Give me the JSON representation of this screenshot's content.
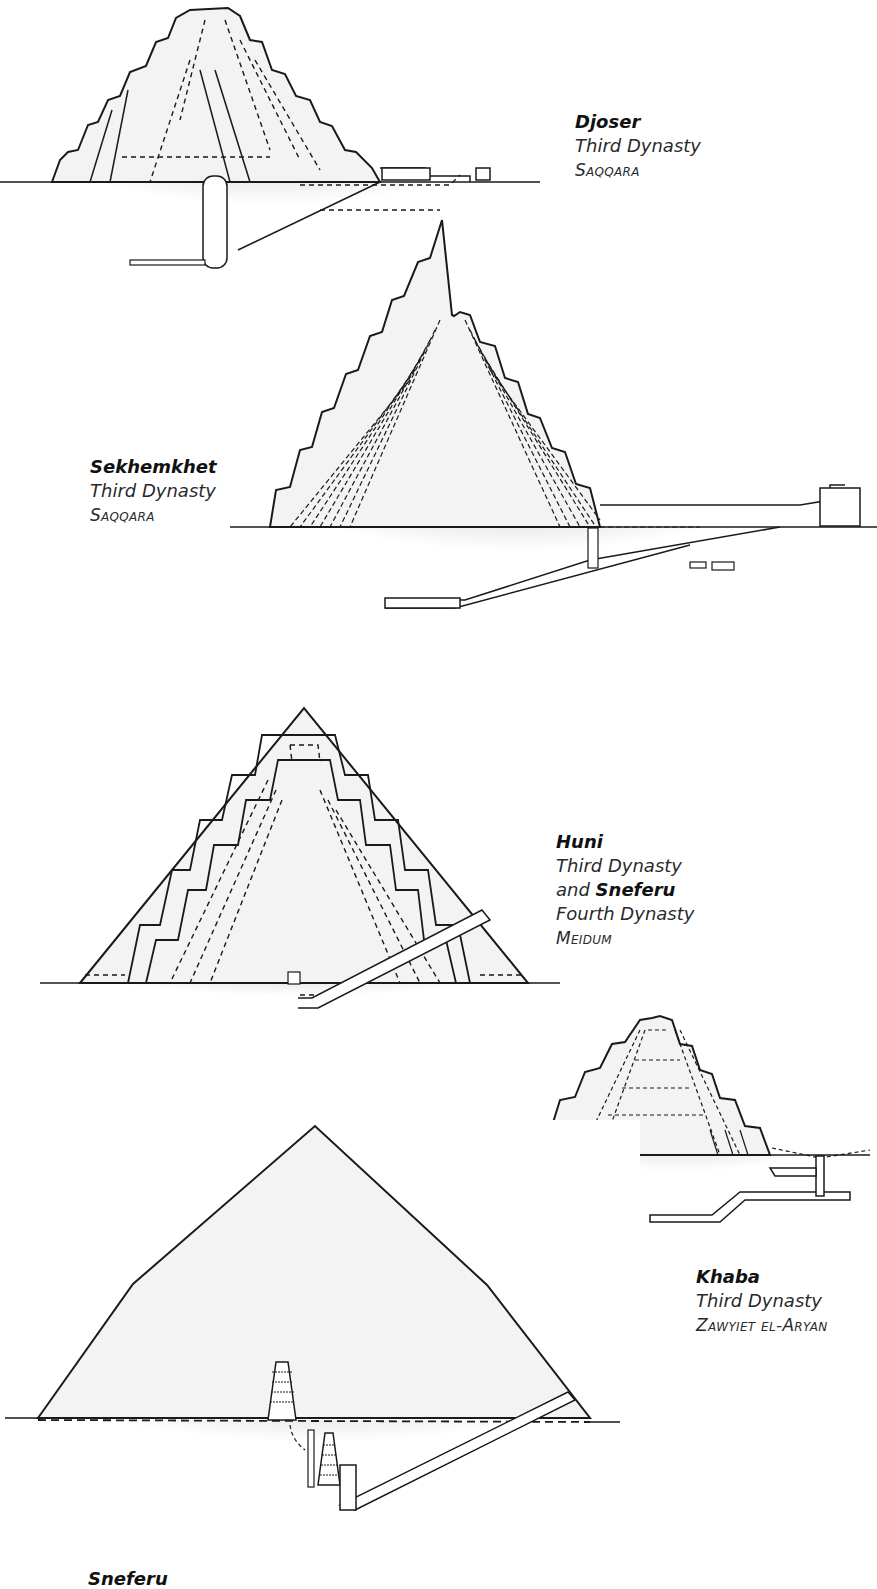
{
  "figure": {
    "kind": "cross-section diagrams of early Egyptian pyramids",
    "colors": {
      "line": "#1a1a1a",
      "pyramid_fill": "#f3f3f3",
      "ground_fill": "#d9d9d9",
      "background": "#ffffff"
    }
  },
  "pyramids": [
    {
      "id": "djoser",
      "name": "Djoser",
      "dynasty": "Third Dynasty",
      "site": "Saqqara"
    },
    {
      "id": "sekhemkhet",
      "name": "Sekhemkhet",
      "dynasty": "Third Dynasty",
      "site": "Saqqara"
    },
    {
      "id": "meidum",
      "name": "Huni",
      "dynasty": "Third Dynasty",
      "conjunction": "and",
      "name2": "Sneferu",
      "dynasty2": "Fourth Dynasty",
      "site": "Meidum"
    },
    {
      "id": "khaba",
      "name": "Khaba",
      "dynasty": "Third Dynasty",
      "site": "Zawyiet el-Aryan"
    },
    {
      "id": "sneferu",
      "name": "Sneferu"
    }
  ]
}
